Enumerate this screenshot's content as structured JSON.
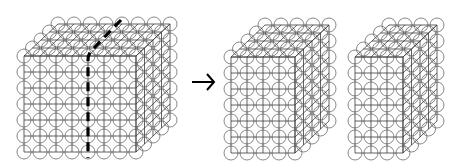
{
  "diagram": {
    "lattices": [
      {
        "name": "full-lattice",
        "columns": 8,
        "rows": 7,
        "depth": 5,
        "has_cut_line": true
      },
      {
        "name": "left-sub-lattice",
        "columns": 5,
        "rows": 7,
        "depth": 5,
        "has_cut_line": false
      },
      {
        "name": "right-sub-lattice",
        "columns": 4,
        "rows": 7,
        "depth": 5,
        "has_cut_line": false
      }
    ],
    "cut_line": {
      "style": "thick-dashed",
      "after_column": 4
    },
    "arrow": {
      "icon": "right-arrow-icon",
      "meaning": "split"
    },
    "colors": {
      "node_stroke": "#6a6a6a",
      "grid_stroke": "#3a3a3a",
      "cut_line": "#000000",
      "background": "#ffffff"
    }
  }
}
